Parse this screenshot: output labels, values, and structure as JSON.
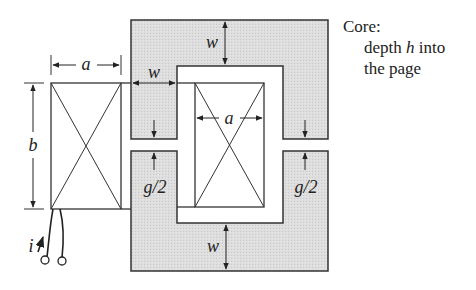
{
  "figure": {
    "type": "magnetic-core-with-air-gaps",
    "labels": {
      "coil_width": "a",
      "coil_height": "b",
      "core_width_top": "w",
      "core_width_leg": "w",
      "core_width_bottom": "w",
      "window_width": "a",
      "gap_left": "g/2",
      "gap_right": "g/2",
      "current": "i"
    },
    "note": {
      "title": "Core:",
      "line1_pre": "depth ",
      "line1_var": "h",
      "line1_post": " into",
      "line2": "the page"
    },
    "colors": {
      "core_fill": "#dcdcdc",
      "stroke": "#333333"
    }
  }
}
